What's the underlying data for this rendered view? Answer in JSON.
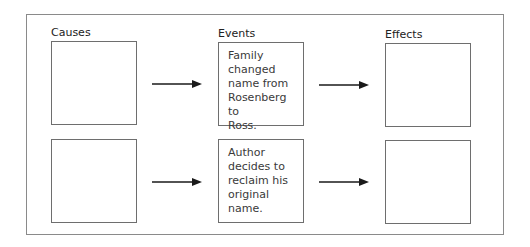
{
  "columns": {
    "causes": "Causes",
    "events": "Events",
    "effects": "Effects"
  },
  "rows": [
    {
      "cause": "",
      "event": "Family changed name from Rosenberg to Ross.",
      "event_lines": [
        "Family",
        "changed",
        "name from",
        "Rosenberg to",
        "Ross."
      ],
      "effect": ""
    },
    {
      "cause": "",
      "event": "Author decides to reclaim his original name.",
      "event_lines": [
        "Author",
        "decides to",
        "reclaim his",
        "original name."
      ],
      "effect": ""
    }
  ],
  "colors": {
    "border": "#6e6e6e",
    "frame": "#8a8a8a",
    "arrow": "#1a1a1a",
    "text": "#3a3a3a"
  }
}
